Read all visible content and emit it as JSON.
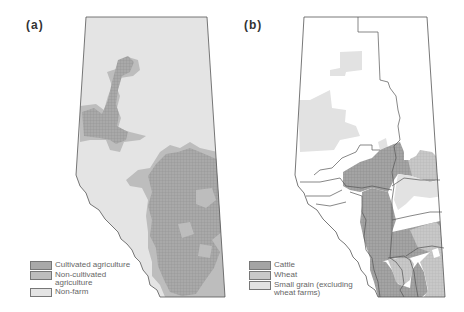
{
  "panels": [
    {
      "id": "a",
      "label": "(a)",
      "legend": [
        {
          "label": "Cultivated agriculture",
          "color": "#a9a9a9",
          "pattern": "grid"
        },
        {
          "label": "Non-cultivated\nagriculture",
          "color": "#bdbdbd",
          "pattern": "solid"
        },
        {
          "label": "Non-farm",
          "color": "#e4e4e4",
          "pattern": "solid"
        }
      ]
    },
    {
      "id": "b",
      "label": "(b)",
      "legend": [
        {
          "label": "Cattle",
          "color": "#a4a4a4",
          "pattern": "grid"
        },
        {
          "label": "Wheat",
          "color": "#c8c8c8",
          "pattern": "grid"
        },
        {
          "label": "Small grain (excluding\nwheat farms)",
          "color": "#e2e2e2",
          "pattern": "solid"
        }
      ]
    }
  ],
  "colors": {
    "outline": "#555555",
    "background": "#ffffff"
  }
}
